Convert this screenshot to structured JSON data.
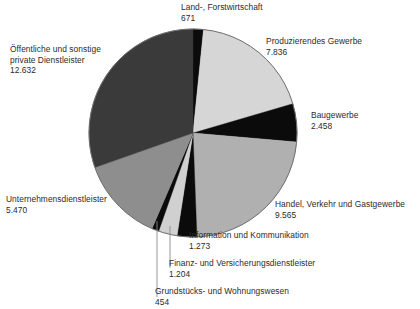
{
  "chart_data": {
    "type": "pie",
    "title": "",
    "subtitle": "",
    "xlabel": "",
    "ylabel": "",
    "legend_position": "callout-labels",
    "grid": false,
    "total": 41563,
    "start_angle_deg": 0,
    "direction": "clockwise",
    "categories": [
      "Land-, Forstwirtschaft",
      "Produzierendes Gewerbe",
      "Baugewerbe",
      "Handel, Verkehr und Gastgewerbe",
      "Information und Kommunikation",
      "Finanz- und Versicherungsdienstleister",
      "Grundstücks- und Wohnungswesen",
      "Unternehmensdienstleister",
      "Öffentliche und sonstige private Dienstleister"
    ],
    "values": [
      671,
      7836,
      2458,
      9565,
      1273,
      1204,
      454,
      5470,
      12632
    ],
    "value_labels": [
      "671",
      "7.836",
      "2.458",
      "9.565",
      "1.273",
      "1.204",
      "454",
      "5.470",
      "12.632"
    ],
    "colors": [
      "#0b0b0b",
      "#d6d6d6",
      "#0b0b0b",
      "#b0b0b0",
      "#0b0b0b",
      "#d0d0d0",
      "#0b0b0b",
      "#8e8e8e",
      "#3a3a3a"
    ]
  },
  "slices": [
    {
      "key": "land",
      "label": "Land-, Forstwirtschaft",
      "value": "671",
      "color": "#0b0b0b"
    },
    {
      "key": "prod",
      "label": "Produzierendes Gewerbe",
      "value": "7.836",
      "color": "#d6d6d6"
    },
    {
      "key": "bau",
      "label": "Baugewerbe",
      "value": "2.458",
      "color": "#0b0b0b"
    },
    {
      "key": "handel",
      "label": "Handel, Verkehr und Gastgewerbe",
      "value": "9.565",
      "color": "#b0b0b0"
    },
    {
      "key": "info",
      "label": "Information und Kommunikation",
      "value": "1.273",
      "color": "#0b0b0b"
    },
    {
      "key": "finanz",
      "label": "Finanz- und Versicherungsdienstleister",
      "value": "1.204",
      "color": "#d0d0d0"
    },
    {
      "key": "grund",
      "label": "Grundstücks- und Wohnungswesen",
      "value": "454",
      "color": "#0b0b0b"
    },
    {
      "key": "unt",
      "label": "Unternehmensdienstleister",
      "value": "5.470",
      "color": "#8e8e8e"
    },
    {
      "key": "oeff",
      "label": "Öffentliche und sonstige private Dienstleister",
      "value": "12.632",
      "color": "#3a3a3a"
    }
  ],
  "labels": {
    "land": {
      "line1": "Land-, Forstwirtschaft",
      "line2": "",
      "value": "671"
    },
    "prod": {
      "line1": "Produzierendes Gewerbe",
      "line2": "",
      "value": "7.836"
    },
    "bau": {
      "line1": "Baugewerbe",
      "line2": "",
      "value": "2.458"
    },
    "handel": {
      "line1": "Handel, Verkehr und Gastgewerbe",
      "line2": "",
      "value": "9.565"
    },
    "info": {
      "line1": "Information und Kommunikation",
      "line2": "",
      "value": "1.273"
    },
    "finanz": {
      "line1": "Finanz- und Versicherungsdienstleister",
      "line2": "",
      "value": "1.204"
    },
    "grund": {
      "line1": "Grundstücks- und Wohnungswesen",
      "line2": "",
      "value": "454"
    },
    "unt": {
      "line1": "Unternehmensdienstleister",
      "line2": "",
      "value": "5.470"
    },
    "oeff": {
      "line1": "Öffentliche und sonstige",
      "line2": "private Dienstleister",
      "value": "12.632"
    }
  },
  "geometry": {
    "cx": 193,
    "cy": 133,
    "r": 104,
    "outline_color": "#6e6e6e",
    "leader_color": "#8a8a8a"
  }
}
